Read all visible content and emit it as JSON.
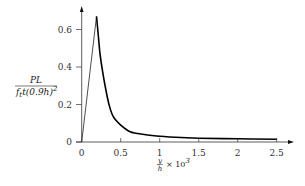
{
  "chart_data": {
    "type": "line",
    "title": "",
    "xlabel": "y/h × 10^3",
    "ylabel": "PL / (f_t t (0.9h)^2)",
    "xlim": [
      0,
      2.5
    ],
    "ylim": [
      0,
      0.7
    ],
    "grid": false,
    "legend": null,
    "x_ticks": [
      {
        "value": 0,
        "label": "0"
      },
      {
        "value": 0.5,
        "label": "0.5"
      },
      {
        "value": 1,
        "label": "1"
      },
      {
        "value": 1.5,
        "label": "1.5"
      },
      {
        "value": 2,
        "label": "2"
      },
      {
        "value": 2.5,
        "label": "2.5"
      }
    ],
    "y_ticks": [
      {
        "value": 0,
        "label": "0"
      },
      {
        "value": 0.2,
        "label": "0.2"
      },
      {
        "value": 0.4,
        "label": "0.4"
      },
      {
        "value": 0.6,
        "label": "0.6"
      }
    ],
    "series": [
      {
        "name": "load-displacement",
        "x": [
          0,
          0.19,
          0.21,
          0.235,
          0.27,
          0.3,
          0.35,
          0.405,
          0.5,
          0.62,
          0.8,
          0.96,
          1.2,
          1.5,
          2.0,
          2.5
        ],
        "y": [
          0,
          0.67,
          0.58,
          0.47,
          0.37,
          0.3,
          0.2,
          0.135,
          0.09,
          0.055,
          0.04,
          0.032,
          0.025,
          0.02,
          0.017,
          0.015
        ]
      }
    ]
  },
  "labels": {
    "y_numerator": "PL",
    "y_denominator": "f",
    "y_denominator_sub": "t",
    "y_denominator_rest": "t(0.9h)",
    "y_denominator_sup": "2",
    "x_frac_num": "y",
    "x_frac_den": "h",
    "x_times": "× 10",
    "x_sup": "3"
  },
  "colors": {
    "axis": "#333333",
    "curve": "#000000"
  }
}
